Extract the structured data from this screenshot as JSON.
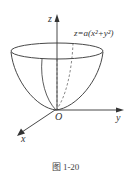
{
  "figure": {
    "equation": "z=a(x²+y²)",
    "caption": "图 1-20",
    "axes": {
      "z_label": "z",
      "y_label": "y",
      "x_label": "x",
      "origin_label": "O"
    },
    "colors": {
      "line": "#333333",
      "background": "#ffffff"
    }
  }
}
